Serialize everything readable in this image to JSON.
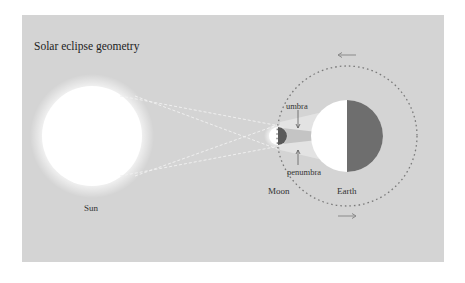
{
  "title": "Solar eclipse geometry",
  "labels": {
    "sun": "Sun",
    "moon": "Moon",
    "earth": "Earth",
    "umbra": "umbra",
    "penumbra": "penumbra"
  },
  "colors": {
    "panel_background": "#d4d4d4",
    "sun": "#ffffff",
    "earth_day": "#ffffff",
    "earth_night": "#6e6e6e",
    "moon_night": "#5a5a5a",
    "orbit": "#7a7a7a",
    "arrow": "#8a8a8a"
  },
  "orbit_direction_arrows": [
    "counterclockwise-top (left-pointing)",
    "bottom (right-pointing)"
  ]
}
